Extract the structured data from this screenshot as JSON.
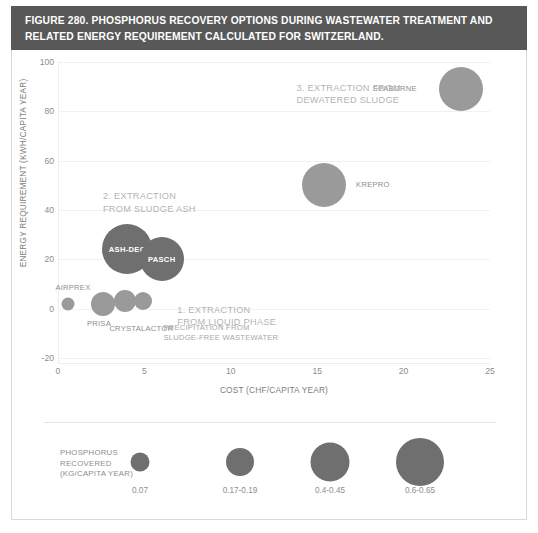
{
  "figure": {
    "title": "FIGURE 280. PHOSPHORUS RECOVERY OPTIONS DURING WASTEWATER TREATMENT AND RELATED ENERGY REQUIREMENT CALCULATED FOR SWITZERLAND.",
    "title_bg": "#585858",
    "title_color": "#ffffff"
  },
  "chart_data": {
    "type": "scatter",
    "title": "FIGURE 280. PHOSPHORUS RECOVERY OPTIONS DURING WASTEWATER TREATMENT AND RELATED ENERGY REQUIREMENT CALCULATED FOR SWITZERLAND.",
    "xlabel": "COST (CHF/CAPITA YEAR)",
    "ylabel": "ENERGY REQUIREMENT (KWH/CAPITA YEAR)",
    "xlim": [
      0,
      25
    ],
    "ylim": [
      -20,
      100
    ],
    "xticks": [
      "0",
      "5",
      "10",
      "15",
      "20",
      "25"
    ],
    "yticks": [
      "100",
      "80",
      "60",
      "40",
      "20",
      "0",
      "-20"
    ],
    "grid": "horizontal",
    "legend_position": "bottom",
    "size_variable": "PHOSPHORUS RECOVERED (KG/CAPITA YEAR)",
    "colors": {
      "bubble_dark": "#6f6f6f",
      "bubble_light": "#9a9a9a",
      "gridline": "#f1f1f1",
      "axis_text": "#8d8d8d",
      "annotation_text": "#b4b4b4"
    },
    "points": [
      {
        "label": "SEABORNE",
        "x": 23.3,
        "y": 89,
        "size": "0.4-0.45",
        "r": 22,
        "tone": "light",
        "label_pos": "left"
      },
      {
        "label": "KREPRO",
        "x": 15.4,
        "y": 50,
        "size": "0.4-0.45",
        "r": 22,
        "tone": "light",
        "label_pos": "right"
      },
      {
        "label": "ASH-DEC",
        "x": 4.0,
        "y": 24,
        "size": "0.6-0.65",
        "r": 25,
        "tone": "dark",
        "label_pos": "inside"
      },
      {
        "label": "PASCH",
        "x": 6.0,
        "y": 20,
        "size": "0.4-0.45",
        "r": 22,
        "tone": "dark",
        "label_pos": "inside"
      },
      {
        "label": "AIRPREX",
        "x": 0.6,
        "y": 2,
        "size": "0.07",
        "r": 6.5,
        "tone": "light",
        "label_pos": "above"
      },
      {
        "label": "PRISA",
        "x": 2.6,
        "y": 2,
        "size": "0.17-0.19",
        "r": 12,
        "tone": "light",
        "label_pos": "below"
      },
      {
        "label": "CRYSTALACTOR",
        "x": 3.9,
        "y": 3,
        "size": "0.17-0.19",
        "r": 11,
        "tone": "light",
        "label_pos": "below"
      },
      {
        "label": "",
        "x": 4.9,
        "y": 3,
        "size": "0.17-0.19",
        "r": 9,
        "tone": "light",
        "label_pos": "none"
      }
    ],
    "annotations": [
      {
        "text": "3. EXTRACTION FROM\nDEWATERED SLUDGE",
        "x": 13.8,
        "y": 92
      },
      {
        "text": "2. EXTRACTION\nFROM SLUDGE ASH",
        "x": 2.6,
        "y": 48
      },
      {
        "text": "1. EXTRACTION\nFROM LIQUID PHASE",
        "x": 6.9,
        "y": 2
      }
    ],
    "sub_annotations": [
      {
        "text": "PRECIPITATION FROM\nSLUDGE-FREE WASTEWATER",
        "x": 6.1,
        "y": -6
      }
    ]
  },
  "legend": {
    "title": "PHOSPHORUS\nRECOVERED\n(KG/CAPITA YEAR)",
    "items": [
      {
        "value": "0.07",
        "r": 9.5
      },
      {
        "value": "0.17-0.19",
        "r": 14
      },
      {
        "value": "0.4-0.45",
        "r": 19.5
      },
      {
        "value": "0.6-0.65",
        "r": 24
      }
    ]
  }
}
